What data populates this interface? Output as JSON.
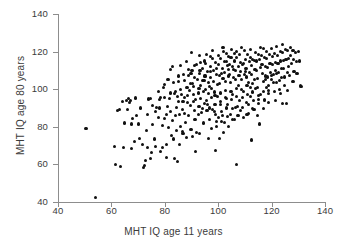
{
  "chart_data": {
    "type": "scatter",
    "title": "",
    "xlabel": "MHT IQ age 11 years",
    "ylabel": "MHT IQ age 80 years",
    "xlim": [
      40,
      140
    ],
    "ylim": [
      40,
      140
    ],
    "xticks": [
      40,
      60,
      80,
      100,
      120,
      140
    ],
    "yticks": [
      40,
      60,
      80,
      100,
      120,
      140
    ],
    "xticklabels": [
      "40",
      "60",
      "80",
      "100",
      "120",
      "140"
    ],
    "yticklabels": [
      "40",
      "60",
      "80",
      "100",
      "120",
      "140"
    ],
    "grid": false,
    "legend": null,
    "marker_color": "#101010",
    "axis_color": "#8d8d8d",
    "background_color": "#ffffff",
    "n_points": 396,
    "correlation_note": "strong positive association",
    "points": [
      [
        50.5,
        79.3
      ],
      [
        54.0,
        42.3
      ],
      [
        61.0,
        69.5
      ],
      [
        61.5,
        59.8
      ],
      [
        62.3,
        88.8
      ],
      [
        63.5,
        59.0
      ],
      [
        64.5,
        69.0
      ],
      [
        65.5,
        93.8
      ],
      [
        66.3,
        95.2
      ],
      [
        66.8,
        93.0
      ],
      [
        67.0,
        94.0
      ],
      [
        67.5,
        81.5
      ],
      [
        68.5,
        72.0
      ],
      [
        69.0,
        95.3
      ],
      [
        70.5,
        74.0
      ],
      [
        71.5,
        70.8
      ],
      [
        72.0,
        58.5
      ],
      [
        72.3,
        59.5
      ],
      [
        72.8,
        62.0
      ],
      [
        73.0,
        77.8
      ],
      [
        73.5,
        86.5
      ],
      [
        74.0,
        94.8
      ],
      [
        74.5,
        95.0
      ],
      [
        75.0,
        66.5
      ],
      [
        75.5,
        81.0
      ],
      [
        76.0,
        73.5
      ],
      [
        76.5,
        88.0
      ],
      [
        77.0,
        90.5
      ],
      [
        77.5,
        85.0
      ],
      [
        78.0,
        94.5
      ],
      [
        78.5,
        95.5
      ],
      [
        79.0,
        80.5
      ],
      [
        79.3,
        69.0
      ],
      [
        79.8,
        84.5
      ],
      [
        80.0,
        102.5
      ],
      [
        80.5,
        86.5
      ],
      [
        80.8,
        63.5
      ],
      [
        81.0,
        91.0
      ],
      [
        81.5,
        79.5
      ],
      [
        81.8,
        95.0
      ],
      [
        82.0,
        110.5
      ],
      [
        82.3,
        88.0
      ],
      [
        82.8,
        83.5
      ],
      [
        83.0,
        112.0
      ],
      [
        83.3,
        73.5
      ],
      [
        83.5,
        97.5
      ],
      [
        84.0,
        86.0
      ],
      [
        84.3,
        78.0
      ],
      [
        84.5,
        90.5
      ],
      [
        84.8,
        61.5
      ],
      [
        85.0,
        104.0
      ],
      [
        85.3,
        93.5
      ],
      [
        85.5,
        86.5
      ],
      [
        85.8,
        80.0
      ],
      [
        86.0,
        112.5
      ],
      [
        86.3,
        97.0
      ],
      [
        86.5,
        89.0
      ],
      [
        86.8,
        76.5
      ],
      [
        87.0,
        108.0
      ],
      [
        87.3,
        95.5
      ],
      [
        87.5,
        87.0
      ],
      [
        87.8,
        82.5
      ],
      [
        88.0,
        114.5
      ],
      [
        88.3,
        101.0
      ],
      [
        88.5,
        93.0
      ],
      [
        88.8,
        86.0
      ],
      [
        89.0,
        107.5
      ],
      [
        89.3,
        99.5
      ],
      [
        89.5,
        91.5
      ],
      [
        89.8,
        78.5
      ],
      [
        90.0,
        119.5
      ],
      [
        90.2,
        110.0
      ],
      [
        90.4,
        103.0
      ],
      [
        90.6,
        97.0
      ],
      [
        90.8,
        101.5
      ],
      [
        91.0,
        88.5
      ],
      [
        91.3,
        84.0
      ],
      [
        91.5,
        94.5
      ],
      [
        91.8,
        77.0
      ],
      [
        92.0,
        113.0
      ],
      [
        92.3,
        105.0
      ],
      [
        92.5,
        98.0
      ],
      [
        92.8,
        91.0
      ],
      [
        93.0,
        108.5
      ],
      [
        93.3,
        102.0
      ],
      [
        93.5,
        95.0
      ],
      [
        93.8,
        87.5
      ],
      [
        94.0,
        111.0
      ],
      [
        94.3,
        104.5
      ],
      [
        94.5,
        99.0
      ],
      [
        94.8,
        92.5
      ],
      [
        95.0,
        115.0
      ],
      [
        95.2,
        107.0
      ],
      [
        95.4,
        100.0
      ],
      [
        95.6,
        94.0
      ],
      [
        95.8,
        88.5
      ],
      [
        96.0,
        109.5
      ],
      [
        96.2,
        103.5
      ],
      [
        96.4,
        97.5
      ],
      [
        96.6,
        90.0
      ],
      [
        96.8,
        84.0
      ],
      [
        97.0,
        112.0
      ],
      [
        97.2,
        106.0
      ],
      [
        97.4,
        100.5
      ],
      [
        97.6,
        95.5
      ],
      [
        97.8,
        89.0
      ],
      [
        98.0,
        116.5
      ],
      [
        98.2,
        110.0
      ],
      [
        98.4,
        104.0
      ],
      [
        98.6,
        98.5
      ],
      [
        98.8,
        92.0
      ],
      [
        99.0,
        86.5
      ],
      [
        99.2,
        80.0
      ],
      [
        99.4,
        108.0
      ],
      [
        99.6,
        102.5
      ],
      [
        99.8,
        96.0
      ],
      [
        100.0,
        118.0
      ],
      [
        100.2,
        113.0
      ],
      [
        100.4,
        107.5
      ],
      [
        100.6,
        103.0
      ],
      [
        100.8,
        98.0
      ],
      [
        101.0,
        93.5
      ],
      [
        101.2,
        88.0
      ],
      [
        101.4,
        83.0
      ],
      [
        101.6,
        111.0
      ],
      [
        101.8,
        105.5
      ],
      [
        102.0,
        120.0
      ],
      [
        102.2,
        114.5
      ],
      [
        102.4,
        109.0
      ],
      [
        102.6,
        104.0
      ],
      [
        102.8,
        99.5
      ],
      [
        103.0,
        95.0
      ],
      [
        103.2,
        90.0
      ],
      [
        103.4,
        85.5
      ],
      [
        103.6,
        112.5
      ],
      [
        103.8,
        107.0
      ],
      [
        104.0,
        117.5
      ],
      [
        104.2,
        113.0
      ],
      [
        104.4,
        108.0
      ],
      [
        104.6,
        103.5
      ],
      [
        104.8,
        99.0
      ],
      [
        105.0,
        94.5
      ],
      [
        105.2,
        89.5
      ],
      [
        105.4,
        84.0
      ],
      [
        105.6,
        110.5
      ],
      [
        105.8,
        106.0
      ],
      [
        106.0,
        119.0
      ],
      [
        106.2,
        115.0
      ],
      [
        106.4,
        110.0
      ],
      [
        106.6,
        105.0
      ],
      [
        106.8,
        100.5
      ],
      [
        107.0,
        96.0
      ],
      [
        107.2,
        91.0
      ],
      [
        107.4,
        86.0
      ],
      [
        107.0,
        59.8
      ],
      [
        107.6,
        112.0
      ],
      [
        107.8,
        107.5
      ],
      [
        108.0,
        118.5
      ],
      [
        108.2,
        114.0
      ],
      [
        108.4,
        109.5
      ],
      [
        108.6,
        105.0
      ],
      [
        108.8,
        100.0
      ],
      [
        109.0,
        95.5
      ],
      [
        109.2,
        90.5
      ],
      [
        109.4,
        85.0
      ],
      [
        109.6,
        113.5
      ],
      [
        109.8,
        108.0
      ],
      [
        110.0,
        120.5
      ],
      [
        110.2,
        116.0
      ],
      [
        110.4,
        111.0
      ],
      [
        110.6,
        106.5
      ],
      [
        110.8,
        102.0
      ],
      [
        111.0,
        97.0
      ],
      [
        111.2,
        92.0
      ],
      [
        111.4,
        87.0
      ],
      [
        111.6,
        114.5
      ],
      [
        111.8,
        109.0
      ],
      [
        112.0,
        121.0
      ],
      [
        112.2,
        117.0
      ],
      [
        112.4,
        112.5
      ],
      [
        112.6,
        108.0
      ],
      [
        112.8,
        103.0
      ],
      [
        113.0,
        98.5
      ],
      [
        113.2,
        94.0
      ],
      [
        113.4,
        89.0
      ],
      [
        113.6,
        115.5
      ],
      [
        113.8,
        110.5
      ],
      [
        114.0,
        119.5
      ],
      [
        114.2,
        115.0
      ],
      [
        114.4,
        110.0
      ],
      [
        114.6,
        105.5
      ],
      [
        114.8,
        101.0
      ],
      [
        115.0,
        96.5
      ],
      [
        115.2,
        92.5
      ],
      [
        115.4,
        81.5
      ],
      [
        115.6,
        116.0
      ],
      [
        115.8,
        111.5
      ],
      [
        116.0,
        122.0
      ],
      [
        116.2,
        118.0
      ],
      [
        116.4,
        113.0
      ],
      [
        116.6,
        108.5
      ],
      [
        116.8,
        104.0
      ],
      [
        117.0,
        99.0
      ],
      [
        117.2,
        94.5
      ],
      [
        117.4,
        117.0
      ],
      [
        117.6,
        112.0
      ],
      [
        117.8,
        107.0
      ],
      [
        118.0,
        120.0
      ],
      [
        118.2,
        116.5
      ],
      [
        118.4,
        111.5
      ],
      [
        118.6,
        106.5
      ],
      [
        118.8,
        102.0
      ],
      [
        119.0,
        97.5
      ],
      [
        119.2,
        118.5
      ],
      [
        119.4,
        113.5
      ],
      [
        119.6,
        109.0
      ],
      [
        120.0,
        121.5
      ],
      [
        120.2,
        117.5
      ],
      [
        120.4,
        113.0
      ],
      [
        120.6,
        108.0
      ],
      [
        120.8,
        103.5
      ],
      [
        121.0,
        99.0
      ],
      [
        121.2,
        119.0
      ],
      [
        121.4,
        114.0
      ],
      [
        121.6,
        110.0
      ],
      [
        122.0,
        122.5
      ],
      [
        122.2,
        118.0
      ],
      [
        122.4,
        113.5
      ],
      [
        122.6,
        109.0
      ],
      [
        122.8,
        104.5
      ],
      [
        123.0,
        100.0
      ],
      [
        123.2,
        120.0
      ],
      [
        123.4,
        115.0
      ],
      [
        123.6,
        111.0
      ],
      [
        124.0,
        124.0
      ],
      [
        124.2,
        119.5
      ],
      [
        124.4,
        115.5
      ],
      [
        124.6,
        111.0
      ],
      [
        124.8,
        106.5
      ],
      [
        125.0,
        102.0
      ],
      [
        125.2,
        121.0
      ],
      [
        125.4,
        116.0
      ],
      [
        125.6,
        92.5
      ],
      [
        126.0,
        120.5
      ],
      [
        126.2,
        116.5
      ],
      [
        126.4,
        112.0
      ],
      [
        126.6,
        107.5
      ],
      [
        127.0,
        122.0
      ],
      [
        127.2,
        118.0
      ],
      [
        127.4,
        113.5
      ],
      [
        128.0,
        120.5
      ],
      [
        128.2,
        116.0
      ],
      [
        128.4,
        109.5
      ],
      [
        129.0,
        119.5
      ],
      [
        129.4,
        114.5
      ],
      [
        130.0,
        120.0
      ],
      [
        130.5,
        115.0
      ],
      [
        130.8,
        102.0
      ],
      [
        131.0,
        101.5
      ],
      [
        112.5,
        73.0
      ],
      [
        115.0,
        94.5
      ],
      [
        117.5,
        94.0
      ],
      [
        119.0,
        99.5
      ],
      [
        124.0,
        92.5
      ],
      [
        99.0,
        67.5
      ],
      [
        96.5,
        74.0
      ],
      [
        93.0,
        76.5
      ],
      [
        90.5,
        75.0
      ],
      [
        88.0,
        74.5
      ],
      [
        86.5,
        77.5
      ],
      [
        100.5,
        74.0
      ],
      [
        102.0,
        77.0
      ],
      [
        104.0,
        80.0
      ],
      [
        106.0,
        84.0
      ],
      [
        108.5,
        88.5
      ],
      [
        82.5,
        75.5
      ],
      [
        80.5,
        70.5
      ],
      [
        78.5,
        67.0
      ],
      [
        76.5,
        69.5
      ],
      [
        74.5,
        63.0
      ],
      [
        73.5,
        69.0
      ],
      [
        70.0,
        81.5
      ],
      [
        68.0,
        84.5
      ],
      [
        66.0,
        89.0
      ],
      [
        64.0,
        93.5
      ],
      [
        83.5,
        63.0
      ],
      [
        85.5,
        70.5
      ],
      [
        91.5,
        67.0
      ],
      [
        94.5,
        82.0
      ],
      [
        97.5,
        79.0
      ],
      [
        99.5,
        83.0
      ],
      [
        101.5,
        86.0
      ],
      [
        103.5,
        92.0
      ],
      [
        105.5,
        97.0
      ],
      [
        107.5,
        102.0
      ],
      [
        109.5,
        99.0
      ],
      [
        111.5,
        103.5
      ],
      [
        113.5,
        105.0
      ],
      [
        89.5,
        103.0
      ],
      [
        91.0,
        106.0
      ],
      [
        93.0,
        118.0
      ],
      [
        95.0,
        104.5
      ],
      [
        97.0,
        117.5
      ],
      [
        99.0,
        114.0
      ],
      [
        101.0,
        116.5
      ],
      [
        103.0,
        119.0
      ],
      [
        105.0,
        121.0
      ],
      [
        107.0,
        117.0
      ],
      [
        109.0,
        113.0
      ],
      [
        111.0,
        118.5
      ],
      [
        113.0,
        116.0
      ],
      [
        115.0,
        118.5
      ],
      [
        117.0,
        121.5
      ],
      [
        86.0,
        100.0
      ],
      [
        84.0,
        99.0
      ],
      [
        82.0,
        98.0
      ],
      [
        80.0,
        95.5
      ],
      [
        78.0,
        90.0
      ],
      [
        88.5,
        96.5
      ],
      [
        92.5,
        86.5
      ],
      [
        94.0,
        89.5
      ],
      [
        96.0,
        92.0
      ],
      [
        98.5,
        88.0
      ],
      [
        100.0,
        85.0
      ],
      [
        102.5,
        82.5
      ],
      [
        104.5,
        86.5
      ],
      [
        106.5,
        90.5
      ],
      [
        108.0,
        94.0
      ],
      [
        110.5,
        93.0
      ],
      [
        112.0,
        96.0
      ],
      [
        114.0,
        100.5
      ],
      [
        116.0,
        97.0
      ],
      [
        118.0,
        101.0
      ],
      [
        120.0,
        105.0
      ],
      [
        122.0,
        108.5
      ],
      [
        91.2,
        112.5
      ],
      [
        93.2,
        110.0
      ],
      [
        95.2,
        113.5
      ],
      [
        97.2,
        109.5
      ],
      [
        99.2,
        111.0
      ],
      [
        101.2,
        108.5
      ],
      [
        103.2,
        114.5
      ],
      [
        105.2,
        112.0
      ],
      [
        87.5,
        104.5
      ],
      [
        89.8,
        108.5
      ],
      [
        85.2,
        107.0
      ],
      [
        83.2,
        103.5
      ],
      [
        81.2,
        105.0
      ],
      [
        79.5,
        101.0
      ],
      [
        77.5,
        99.0
      ],
      [
        75.5,
        91.5
      ],
      [
        71.0,
        90.0
      ],
      [
        69.5,
        86.0
      ],
      [
        67.5,
        68.5
      ],
      [
        65.0,
        82.0
      ],
      [
        63.0,
        89.0
      ],
      [
        100.8,
        92.0
      ],
      [
        102.8,
        95.5
      ],
      [
        98.8,
        96.5
      ],
      [
        96.8,
        101.5
      ],
      [
        94.8,
        107.0
      ],
      [
        92.8,
        100.5
      ],
      [
        90.8,
        93.5
      ],
      [
        88.8,
        110.5
      ],
      [
        86.8,
        93.5
      ],
      [
        84.8,
        96.0
      ],
      [
        110.8,
        86.5
      ],
      [
        112.8,
        89.5
      ],
      [
        114.8,
        86.0
      ],
      [
        116.8,
        89.5
      ],
      [
        118.8,
        93.0
      ],
      [
        121.5,
        94.0
      ],
      [
        123.5,
        97.5
      ],
      [
        126.0,
        99.5
      ],
      [
        128.0,
        104.0
      ],
      [
        129.5,
        108.5
      ],
      [
        104.8,
        117.0
      ],
      [
        106.8,
        120.0
      ],
      [
        108.8,
        122.0
      ],
      [
        110.2,
        109.5
      ],
      [
        112.2,
        101.0
      ],
      [
        95.5,
        118.5
      ],
      [
        93.5,
        114.0
      ],
      [
        97.8,
        120.5
      ],
      [
        101.8,
        122.0
      ],
      [
        103.8,
        110.5
      ],
      [
        117.8,
        105.0
      ],
      [
        119.8,
        107.5
      ],
      [
        121.8,
        103.5
      ],
      [
        123.8,
        106.0
      ],
      [
        125.8,
        109.0
      ]
    ]
  }
}
